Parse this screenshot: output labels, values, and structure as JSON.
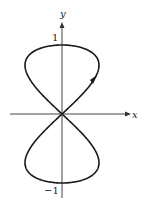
{
  "figure": {
    "type": "parametric curve (figure-eight)",
    "x_axis_label": "x",
    "y_axis_label": "y",
    "y_tick_top": "1",
    "y_tick_bottom": "−1",
    "direction_arrow": "counterclockwise-up in first quadrant"
  },
  "chart_data": {
    "type": "line",
    "title": "",
    "xlabel": "x",
    "ylabel": "y",
    "ylim": [
      -1,
      1
    ],
    "xlim": [
      -0.5,
      0.5
    ],
    "series": [
      {
        "name": "curve",
        "parametric": "x = sin(t)cos(t), y = sin(t)",
        "ticks": {
          "y": [
            1,
            -1
          ]
        }
      }
    ],
    "grid": false
  },
  "colors": {
    "curve": "#1a1a1a",
    "axis": "#333333"
  }
}
